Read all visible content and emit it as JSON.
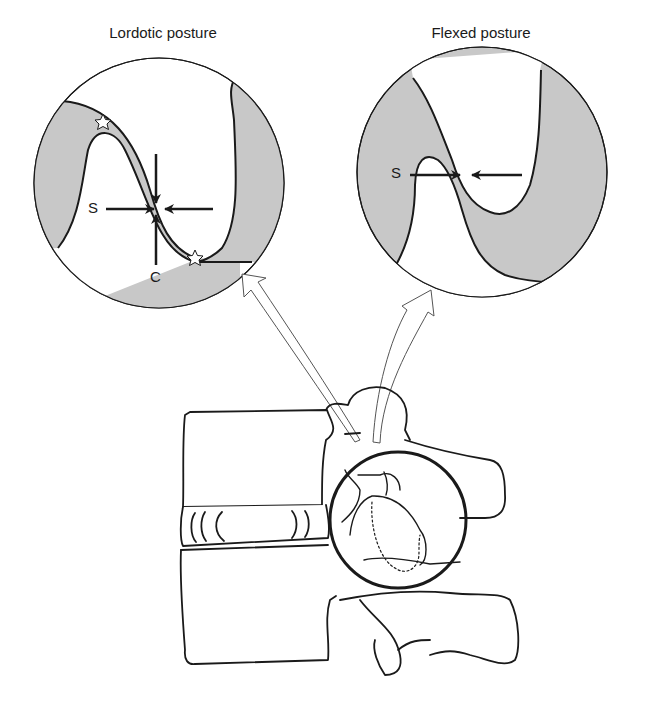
{
  "figure": {
    "panels": [
      {
        "id": "lordotic",
        "title": "Lordotic posture",
        "labels": {
          "shear": "S",
          "compression": "C"
        },
        "markers": [
          "star",
          "star"
        ]
      },
      {
        "id": "flexed",
        "title": "Flexed posture",
        "labels": {
          "shear": "S"
        }
      }
    ],
    "colors": {
      "tissue_fill": "#c8c8c8",
      "line": "#1a1a1a",
      "background": "#ffffff"
    },
    "base_illustration": "lumbar vertebrae lateral view with magnified facet joint"
  }
}
